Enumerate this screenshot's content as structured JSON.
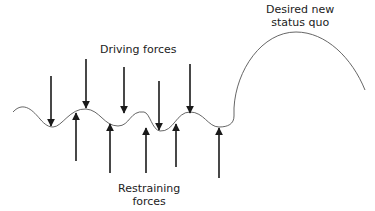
{
  "diagram": {
    "type": "force-field-analysis",
    "labels": {
      "driving": "Driving forces",
      "restraining_line1": "Restraining",
      "restraining_line2": "forces",
      "desired_line1": "Desired new",
      "desired_line2": "status quo"
    },
    "colors": {
      "line": "#555555",
      "arrow": "#1a1a1a",
      "text": "#222222"
    },
    "driving_arrows": [
      {
        "x": 51,
        "y1": 76,
        "y2": 126
      },
      {
        "x": 86,
        "y1": 59,
        "y2": 108
      },
      {
        "x": 124,
        "y1": 67,
        "y2": 113
      },
      {
        "x": 159,
        "y1": 81,
        "y2": 130
      },
      {
        "x": 190,
        "y1": 64,
        "y2": 113
      }
    ],
    "restraining_arrows": [
      {
        "x": 76,
        "y1": 161,
        "y2": 113
      },
      {
        "x": 110,
        "y1": 173,
        "y2": 124
      },
      {
        "x": 146,
        "y1": 173,
        "y2": 128
      },
      {
        "x": 176,
        "y1": 167,
        "y2": 124
      },
      {
        "x": 219,
        "y1": 178,
        "y2": 128
      }
    ]
  }
}
